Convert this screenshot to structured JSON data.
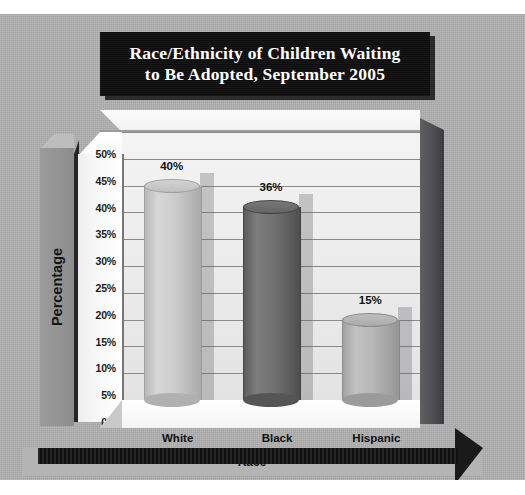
{
  "chart_data": {
    "type": "bar",
    "title": "Race/Ethnicity of Children Waiting to Be Adopted, September 2005",
    "title_line1": "Race/Ethnicity of Children Waiting",
    "title_line2": "to Be Adopted, September 2005",
    "categories": [
      "White",
      "Black",
      "Hispanic"
    ],
    "values": [
      40,
      36,
      15
    ],
    "data_labels": [
      "40%",
      "36%",
      "15%"
    ],
    "xlabel": "Race",
    "ylabel": "Percentage",
    "ylim": [
      0,
      50
    ],
    "ytick_step": 5,
    "ytick_labels": [
      "50%",
      "45%",
      "40%",
      "35%",
      "30%",
      "25%",
      "20%",
      "15%",
      "10%",
      "5%",
      "0%"
    ],
    "grid": true,
    "legend": false,
    "style": "3d-cylinder",
    "series_colors": [
      "#c9c9c9",
      "#6e6e6e",
      "#b4b4b4"
    ]
  },
  "colors": {
    "card_background": "#b0b0b0",
    "title_plaque": "#111111",
    "title_text": "#ffffff",
    "plot_back_wall": "#ececec",
    "plot_side_wall": "#4d4d51",
    "plot_floor": "#ffffff",
    "gridline": "#8a8a8a",
    "axis_band": "#8d8d8d",
    "base_bar": "#141414",
    "label_text": "#111111"
  }
}
